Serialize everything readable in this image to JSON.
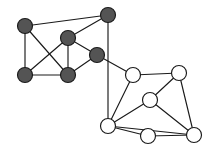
{
  "figure": {
    "name": "two-cluster-graph",
    "background_color": "#ffffff",
    "width": 218,
    "height": 156
  },
  "chart_data": {
    "type": "graph",
    "title": "",
    "xlabel": "",
    "ylabel": "",
    "grid": false,
    "legend": "none",
    "xlim": [
      0,
      218
    ],
    "ylim": [
      0,
      156
    ],
    "node_radius": 7.5,
    "edge_color": "#1a1a1a",
    "edge_width": 1.15,
    "node_groups": [
      {
        "name": "dark-cluster",
        "fill": "#545454",
        "stroke": "#1a1a1a",
        "count": 6
      },
      {
        "name": "light-cluster",
        "fill": "#ffffff",
        "stroke": "#1a1a1a",
        "count": 6
      }
    ],
    "nodes": [
      {
        "id": "d1",
        "group": "dark-cluster",
        "label": "",
        "x": 25,
        "y": 26
      },
      {
        "id": "d2",
        "group": "dark-cluster",
        "label": "",
        "x": 108,
        "y": 15
      },
      {
        "id": "d3",
        "group": "dark-cluster",
        "label": "",
        "x": 68,
        "y": 38
      },
      {
        "id": "d4",
        "group": "dark-cluster",
        "label": "",
        "x": 97,
        "y": 55
      },
      {
        "id": "d5",
        "group": "dark-cluster",
        "label": "",
        "x": 25,
        "y": 75
      },
      {
        "id": "d6",
        "group": "dark-cluster",
        "label": "",
        "x": 68,
        "y": 75
      },
      {
        "id": "w1",
        "group": "light-cluster",
        "label": "",
        "x": 133,
        "y": 75
      },
      {
        "id": "w2",
        "group": "light-cluster",
        "label": "",
        "x": 179,
        "y": 73
      },
      {
        "id": "w3",
        "group": "light-cluster",
        "label": "",
        "x": 150,
        "y": 100
      },
      {
        "id": "w4",
        "group": "light-cluster",
        "label": "",
        "x": 108,
        "y": 126
      },
      {
        "id": "w5",
        "group": "light-cluster",
        "label": "",
        "x": 148,
        "y": 136
      },
      {
        "id": "w6",
        "group": "light-cluster",
        "label": "",
        "x": 194,
        "y": 135
      }
    ],
    "edges": [
      {
        "source": "d1",
        "target": "d2"
      },
      {
        "source": "d1",
        "target": "d5"
      },
      {
        "source": "d1",
        "target": "d6"
      },
      {
        "source": "d2",
        "target": "d3"
      },
      {
        "source": "d2",
        "target": "w4"
      },
      {
        "source": "d3",
        "target": "d5"
      },
      {
        "source": "d3",
        "target": "d6"
      },
      {
        "source": "d3",
        "target": "d4"
      },
      {
        "source": "d4",
        "target": "d6"
      },
      {
        "source": "d4",
        "target": "w1"
      },
      {
        "source": "d5",
        "target": "d6"
      },
      {
        "source": "w1",
        "target": "w2"
      },
      {
        "source": "w1",
        "target": "w4"
      },
      {
        "source": "w2",
        "target": "w3"
      },
      {
        "source": "w2",
        "target": "w6"
      },
      {
        "source": "w3",
        "target": "w4"
      },
      {
        "source": "w3",
        "target": "w6"
      },
      {
        "source": "w4",
        "target": "w5"
      },
      {
        "source": "w4",
        "target": "w6"
      },
      {
        "source": "w5",
        "target": "w6"
      }
    ]
  }
}
